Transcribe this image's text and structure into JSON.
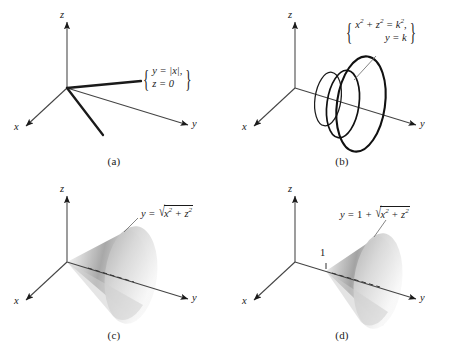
{
  "figure": {
    "kind": "math-figure-4-panels",
    "background": "#ffffff",
    "ink": "#1a1a1a"
  },
  "panels": [
    {
      "id": "a",
      "caption": "(a)",
      "axes": {
        "x_label": "x",
        "y_label": "y",
        "z_label": "z"
      },
      "label": {
        "type": "system-brace",
        "line1": "y = |x|,",
        "line2": "z = 0",
        "brace_left": "{",
        "brace_right": "}"
      },
      "graphic": "two thick rays from origin forming V of y=|x| in plane z=0",
      "description": "trace of y = |x| in the z = 0 plane"
    },
    {
      "id": "b",
      "caption": "(b)",
      "axes": {
        "x_label": "x",
        "y_label": "y",
        "z_label": "z"
      },
      "label": {
        "type": "system-brace",
        "line1_parts": [
          "x",
          "2",
          " + ",
          "z",
          "2",
          " = ",
          "k",
          "2",
          ","
        ],
        "line1_plain": "x² + z² = k²,",
        "line2_plain": "y = k",
        "brace_left": "{",
        "brace_right": "}"
      },
      "graphic": "three circles of radius k in planes y = k, increasing with y",
      "circle_count": 3,
      "description": "cross-sections x² + z² = k² in planes y = k"
    },
    {
      "id": "c",
      "caption": "(c)",
      "axes": {
        "x_label": "x",
        "y_label": "y",
        "z_label": "z"
      },
      "label": {
        "type": "equation",
        "lhs": "y",
        "relation": "=",
        "radicand_plain": "x² + z²",
        "plain": "y = √(x² + z²)"
      },
      "graphic": "shaded cone with apex at origin opening along +y",
      "apex_at": "origin",
      "description": "cone y = sqrt(x² + z²)"
    },
    {
      "id": "d",
      "caption": "(d)",
      "axes": {
        "x_label": "x",
        "y_label": "y",
        "z_label": "z"
      },
      "tick": {
        "label": "1",
        "axis": "y"
      },
      "label": {
        "type": "equation",
        "lhs": "y",
        "relation": "=",
        "offset": "1",
        "radicand_plain": "x² + z²",
        "plain": "y = 1 + √(x² + z²)"
      },
      "graphic": "shaded cone with apex at y = 1 opening along +y",
      "apex_at": "y = 1",
      "description": "cone y = 1 + sqrt(x² + z²)"
    }
  ],
  "symbols": {
    "radical": "√",
    "brace_open": "{",
    "brace_close": "}",
    "abs_open": "|",
    "abs_close": "|",
    "plus": "+",
    "equals": "="
  }
}
